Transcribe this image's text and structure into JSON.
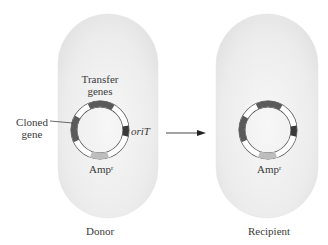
{
  "diagram": {
    "type": "bacterial-conjugation-plasmid-transfer",
    "colors": {
      "cell_fill": "#eeeeee",
      "cell_edge": "#e2e2e2",
      "ring_fill": "#ffffff",
      "ring_stroke": "#555555",
      "transfer_genes": "#5a5a5a",
      "cloned_gene": "#5a5a5a",
      "oriT": "#3a3a3a",
      "ampR": "#bdbdbd",
      "arrow": "#222222"
    },
    "donor": {
      "label": "Donor",
      "plasmid_labels": {
        "transfer_line1": "Transfer",
        "transfer_line2": "genes",
        "cloned_line1": "Cloned",
        "cloned_line2": "gene",
        "oriT": "oriT",
        "amp_base": "Amp",
        "amp_sup": "r"
      }
    },
    "recipient": {
      "label": "Recipient",
      "plasmid_labels": {
        "amp_base": "Amp",
        "amp_sup": "r"
      }
    },
    "arrow": {
      "direction": "right",
      "meaning": "plasmid transfer"
    }
  }
}
